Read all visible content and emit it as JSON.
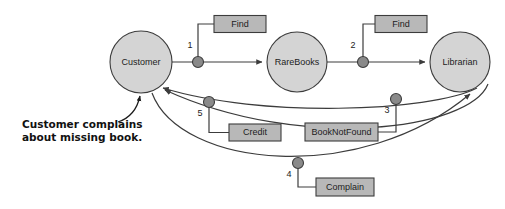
{
  "diagram": {
    "type": "uml-collaboration-diagram",
    "background_color": "#ffffff",
    "object_fill": "#d4d4d4",
    "message_box_fill": "#b8b8b8",
    "dot_fill": "#8a8a8a",
    "line_color": "#3c3c3c",
    "objects": [
      {
        "id": "customer",
        "label": "Customer",
        "cx": 141,
        "cy": 62,
        "r": 31
      },
      {
        "id": "rarebooks",
        "label": "RareBooks",
        "cx": 297,
        "cy": 62,
        "r": 30
      },
      {
        "id": "librarian",
        "label": "Librarian",
        "cx": 460,
        "cy": 62,
        "r": 30
      }
    ],
    "messages": [
      {
        "seq": "1",
        "label": "Find",
        "from": "customer",
        "to": "rarebooks"
      },
      {
        "seq": "2",
        "label": "Find",
        "from": "rarebooks",
        "to": "librarian"
      },
      {
        "seq": "3",
        "label": "BookNotFound",
        "from": "librarian",
        "to": "customer"
      },
      {
        "seq": "4",
        "label": "Complain",
        "from": "customer",
        "to": "librarian"
      },
      {
        "seq": "5",
        "label": "Credit",
        "from": "librarian",
        "to": "customer"
      }
    ],
    "note": {
      "line1": "Customer complains",
      "line2": "about missing book.",
      "points_to": "customer"
    }
  }
}
